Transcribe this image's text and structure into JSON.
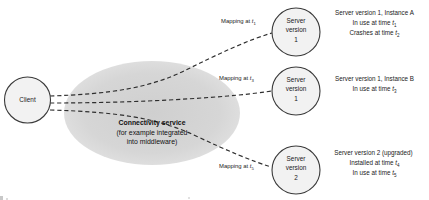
{
  "diagram": {
    "type": "distributed-systems-versioning-diagram",
    "client": {
      "label": "Client"
    },
    "connectivity_service": {
      "title": "Connectivity service",
      "subtitle_line1": "(for example integrated",
      "subtitle_line2": "into middleware)",
      "fill_color": "#d4d4d4"
    },
    "mappings": [
      {
        "id": "mapping-t1",
        "prefix": "Mapping at ",
        "symbol": "t",
        "subscript": "1"
      },
      {
        "id": "mapping-t3",
        "prefix": "Mapping at ",
        "symbol": "t",
        "subscript": "3"
      },
      {
        "id": "mapping-t5",
        "prefix": "Mapping at ",
        "symbol": "t",
        "subscript": "5"
      }
    ],
    "servers": [
      {
        "id": "server-version-1-instance-a",
        "line1": "Server",
        "line2": "version",
        "line3": "1"
      },
      {
        "id": "server-version-1-instance-b",
        "line1": "Server",
        "line2": "version",
        "line3": "1"
      },
      {
        "id": "server-version-2-upgraded",
        "line1": "Server",
        "line2": "version",
        "line3": "2"
      }
    ],
    "annotations": [
      {
        "id": "annotation-instance-a",
        "title": "Server version 1, Instance A",
        "lines": [
          {
            "text": "In use at time ",
            "symbol": "t",
            "subscript": "1"
          },
          {
            "text": "Crashes at time ",
            "symbol": "t",
            "subscript": "2"
          }
        ]
      },
      {
        "id": "annotation-instance-b",
        "title": "Server version 1, Instance B",
        "lines": [
          {
            "text": "In use at time ",
            "symbol": "t",
            "subscript": "3"
          }
        ]
      },
      {
        "id": "annotation-version-2",
        "title": "Server version 2 (upgraded)",
        "lines": [
          {
            "text": "Installed at time ",
            "symbol": "t",
            "subscript": "4"
          },
          {
            "text": "In use at time ",
            "symbol": "t",
            "subscript": "5"
          }
        ]
      }
    ],
    "style": {
      "stroke_color": "#3a3a3a",
      "dash_color": "#2e2e2e",
      "node_fill": "#f2f2f2",
      "background": "#ffffff"
    }
  }
}
